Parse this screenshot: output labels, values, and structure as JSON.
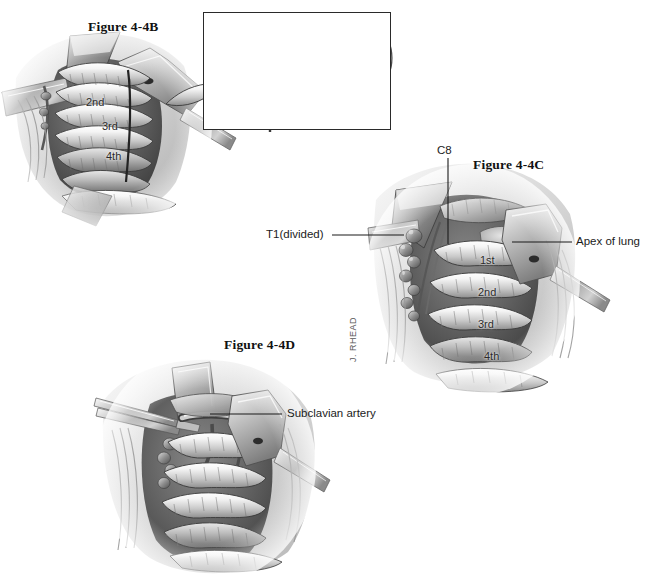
{
  "plate": {
    "title_b": "Figure 4-4B",
    "title_c": "Figure 4-4C",
    "title_d": "Figure 4-4D",
    "artist_signature": "J. RHEAD",
    "background_color": "#ffffff",
    "ink_color": "#2a2a2a"
  },
  "figure_b": {
    "title": "Figure 4-4B",
    "rib_labels": [
      "2nd",
      "3rd",
      "4th"
    ]
  },
  "inset": {
    "caption": "",
    "description": "vertebral cross-section with tumor and dashed resection line"
  },
  "figure_c": {
    "title": "Figure 4-4C",
    "labels": {
      "c8": "C8",
      "t1_divided": "T1(divided)",
      "apex_of_lung": "Apex of lung"
    },
    "rib_labels": [
      "1st",
      "2nd",
      "3rd",
      "4th"
    ]
  },
  "figure_d": {
    "title": "Figure 4-4D",
    "labels": {
      "subclavian_artery": "Subclavian artery"
    }
  }
}
